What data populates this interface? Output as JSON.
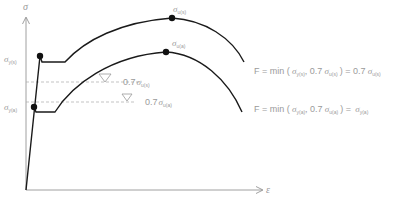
{
  "axes": {
    "y_label": "σ",
    "x_label": "ε"
  },
  "labels": {
    "ultimate_upper": {
      "sym": "σ",
      "sub": "u(s)"
    },
    "ultimate_lower": {
      "sym": "σ",
      "sub": "u(a)"
    },
    "yield_upper": {
      "sym": "σ",
      "sub": "y(s)"
    },
    "yield_lower": {
      "sym": "σ",
      "sub": "y(a)"
    },
    "ref_upper": {
      "coef": "0.7",
      "sym": "σ",
      "sub": "u(s)"
    },
    "ref_lower": {
      "coef": "0.7",
      "sym": "σ",
      "sub": "u(a)"
    }
  },
  "formulas": {
    "upper": {
      "lhs": "F = min (",
      "a_sym": "σ",
      "a_sub": "y(s)",
      "mid": ", 0.7",
      "b_sym": "σ",
      "b_sub": "u(s)",
      "eq": ") = 0.7",
      "r_sym": "σ",
      "r_sub": "u(s)"
    },
    "lower": {
      "lhs": "F = min (",
      "a_sym": "σ",
      "a_sub": "y(a)",
      "mid": ", 0.7",
      "b_sym": "σ",
      "b_sub": "u(a)",
      "eq": ") =",
      "r_sym": "σ",
      "r_sub": "y(a)"
    }
  },
  "colors": {
    "curve": "#1a1a1a",
    "axis": "#777777",
    "text": "#9a9a9a",
    "dashed": "#aaaaaa"
  }
}
